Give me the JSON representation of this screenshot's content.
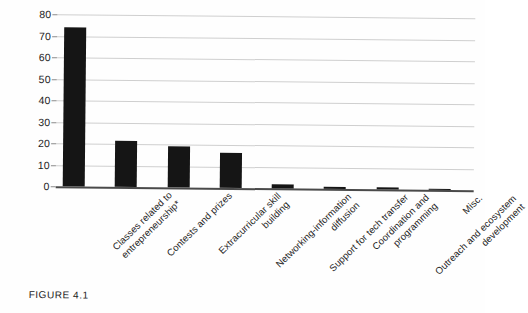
{
  "caption": {
    "label": "FIGURE 4.1"
  },
  "chart_data": {
    "type": "bar",
    "title": "",
    "xlabel": "",
    "ylabel": "",
    "ylim": [
      0,
      80
    ],
    "yticks": [
      0,
      10,
      20,
      30,
      40,
      50,
      60,
      70,
      80
    ],
    "grid": true,
    "legend": "none",
    "orientation": "vertical",
    "bar_color": "#151515",
    "gridline_color": "#cfcfcf",
    "axis_color": "#4a4a4a",
    "categories": [
      "Classes related to entrepreneurship*",
      "Contests and prizes",
      "Extracurricular skill building",
      "Networking-information diffusion",
      "Support for tech transfer",
      "Coordination and programming",
      "Outreach and ecosystem development",
      "Misc."
    ],
    "category_lines": [
      [
        "Classes related to",
        "entrepreneurship*"
      ],
      [
        "Contests and prizes"
      ],
      [
        "Extracurricular skill",
        "building"
      ],
      [
        "Networking-information",
        "diffusion"
      ],
      [
        "Support for tech transfer"
      ],
      [
        "Coordination and",
        "programming"
      ],
      [
        "Outreach and ecosystem",
        "development"
      ],
      [
        "Misc."
      ]
    ],
    "values": [
      74,
      21.5,
      19,
      16.5,
      2,
      1,
      0.8,
      0.3
    ]
  }
}
